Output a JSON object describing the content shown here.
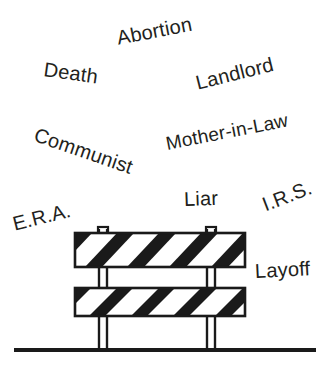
{
  "illustration": {
    "title": "Barricade with labels",
    "ink_color": "#231f20",
    "background_color": "#ffffff",
    "ground_line": {
      "x1": 14,
      "x2": 316,
      "y": 350,
      "thickness": 4
    },
    "barricade": {
      "name": "striped-road-barricade",
      "stripe_color": "#1a1a1a",
      "board_fill": "#ffffff",
      "outline_color": "#1a1a1a",
      "boards": [
        {
          "name": "upper-board",
          "x": 75,
          "y": 233,
          "width": 170,
          "height": 34
        },
        {
          "name": "lower-board",
          "x": 75,
          "y": 288,
          "width": 170,
          "height": 28
        }
      ],
      "legs": [
        {
          "name": "left-leg",
          "x": 97,
          "width": 11,
          "top": 228,
          "bottom": 350
        },
        {
          "name": "right-leg",
          "x": 205,
          "width": 11,
          "top": 228,
          "bottom": 350
        }
      ],
      "leg_tabs": [
        {
          "name": "left-leg-tab",
          "x": 98,
          "y": 227,
          "width": 10,
          "height": 7
        },
        {
          "name": "right-leg-tab",
          "x": 206,
          "y": 227,
          "width": 10,
          "height": 7
        }
      ]
    }
  },
  "labels": [
    {
      "id": "abortion",
      "text": "Abortion",
      "x": 117,
      "y": 38,
      "rotate": -11,
      "size": 20
    },
    {
      "id": "death",
      "text": "Death",
      "x": 44,
      "y": 69,
      "rotate": 8,
      "size": 20
    },
    {
      "id": "landlord",
      "text": "Landlord",
      "x": 196,
      "y": 83,
      "rotate": -14,
      "size": 20
    },
    {
      "id": "communist",
      "text": "Communist",
      "x": 35,
      "y": 134,
      "rotate": 19,
      "size": 20
    },
    {
      "id": "mother-in-law",
      "text": "Mother-in-Law",
      "x": 166,
      "y": 143,
      "rotate": -11,
      "size": 19
    },
    {
      "id": "liar",
      "text": "Liar",
      "x": 184,
      "y": 199,
      "rotate": -2,
      "size": 20
    },
    {
      "id": "irs",
      "text": "I.R.S.",
      "x": 263,
      "y": 205,
      "rotate": -21,
      "size": 20
    },
    {
      "id": "era",
      "text": "E.R.A.",
      "x": 13,
      "y": 224,
      "rotate": -14,
      "size": 20
    },
    {
      "id": "layoff",
      "text": "Layoff",
      "x": 255,
      "y": 271,
      "rotate": -3,
      "size": 20
    }
  ]
}
